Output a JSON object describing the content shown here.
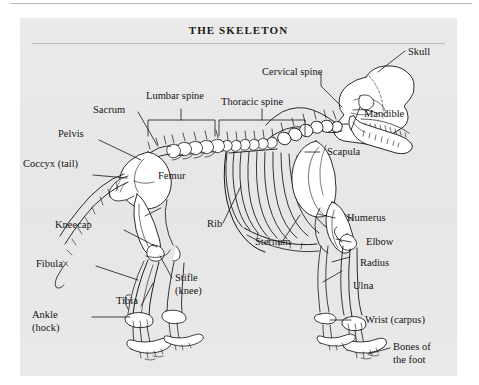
{
  "figure": {
    "title": "THE SKELETON",
    "background_color": "#e8e8e8",
    "ink_color": "#141414"
  },
  "labels": [
    {
      "id": "skull",
      "text": "Skull",
      "align": "left"
    },
    {
      "id": "cervical",
      "text": "Cervical spine",
      "align": "left"
    },
    {
      "id": "thoracic",
      "text": "Thoracic spine",
      "align": "left"
    },
    {
      "id": "lumbar",
      "text": "Lumbar spine",
      "align": "left"
    },
    {
      "id": "sacrum",
      "text": "Sacrum",
      "align": "left"
    },
    {
      "id": "pelvis",
      "text": "Pelvis",
      "align": "left"
    },
    {
      "id": "coccyx",
      "text": "Coccyx (tail)",
      "align": "left"
    },
    {
      "id": "mandible",
      "text": "Mandible",
      "align": "left"
    },
    {
      "id": "scapula",
      "text": "Scapula",
      "align": "left"
    },
    {
      "id": "humerus",
      "text": "Humerus",
      "align": "left"
    },
    {
      "id": "elbow",
      "text": "Elbow",
      "align": "left"
    },
    {
      "id": "radius",
      "text": "Radius",
      "align": "left"
    },
    {
      "id": "ulna",
      "text": "Ulna",
      "align": "left"
    },
    {
      "id": "wrist",
      "text": "Wrist (carpus)",
      "align": "left"
    },
    {
      "id": "bones-of-foot",
      "text": "Bones of",
      "align": "left"
    },
    {
      "id": "bones-of-foot2",
      "text": "the foot",
      "align": "left"
    },
    {
      "id": "sternum",
      "text": "Sternum",
      "align": "left"
    },
    {
      "id": "rib",
      "text": "Rib",
      "align": "left"
    },
    {
      "id": "femur",
      "text": "Femur",
      "align": "left"
    },
    {
      "id": "stifle",
      "text": "Stifle",
      "align": "left"
    },
    {
      "id": "stifle2",
      "text": "(knee)",
      "align": "left"
    },
    {
      "id": "kneecap",
      "text": "Kneecap",
      "align": "left"
    },
    {
      "id": "fibula",
      "text": "Fibula",
      "align": "left"
    },
    {
      "id": "tibia",
      "text": "Tibia",
      "align": "left"
    },
    {
      "id": "ankle",
      "text": "Ankle",
      "align": "left"
    },
    {
      "id": "ankle2",
      "text": "(hock)",
      "align": "left"
    }
  ]
}
